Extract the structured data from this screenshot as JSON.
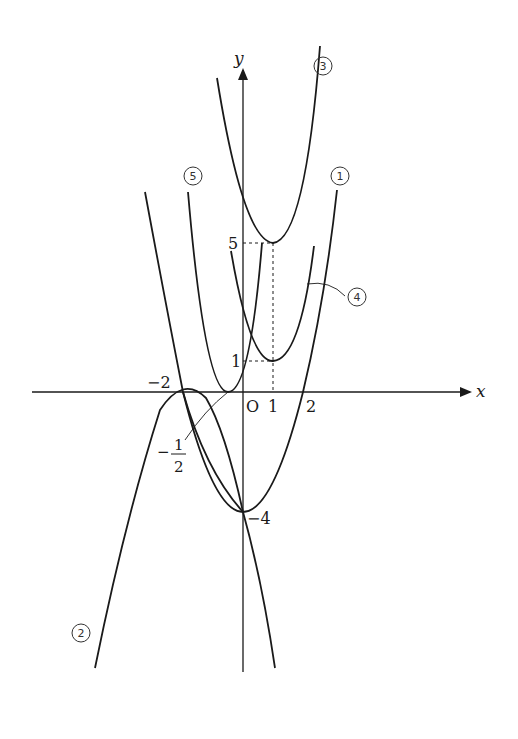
{
  "diagram": {
    "type": "graphs of quadratic functions on xy-plane",
    "axes": {
      "x_label": "x",
      "y_label": "y",
      "origin_label": "O"
    },
    "tick_labels": {
      "x_neg2": "−2",
      "x_1": "1",
      "x_2": "2",
      "y_5": "5",
      "y_1": "1",
      "y_neg4": "−4",
      "frac_sign": "−",
      "frac_num": "1",
      "frac_den": "2"
    },
    "curve_labels": {
      "c1": "1",
      "c2": "2",
      "c3": "3",
      "c4": "4",
      "c5": "5"
    },
    "curves": [
      {
        "id": "1",
        "vertex": [
          0,
          -4
        ],
        "x_intercepts": [
          -2,
          2
        ],
        "opens": "up"
      },
      {
        "id": "2",
        "vertex": [
          -2,
          0
        ],
        "passes_through": [
          0,
          -4
        ],
        "opens": "down"
      },
      {
        "id": "3",
        "vertex": [
          1,
          5
        ],
        "opens": "up"
      },
      {
        "id": "4",
        "vertex": [
          1,
          1
        ],
        "opens": "up"
      },
      {
        "id": "5",
        "vertex": [
          -0.5,
          0
        ],
        "passes_through": [
          0,
          1
        ],
        "opens": "up"
      }
    ],
    "colors": {
      "stroke": "#1a1a1a",
      "background": "#ffffff"
    }
  }
}
